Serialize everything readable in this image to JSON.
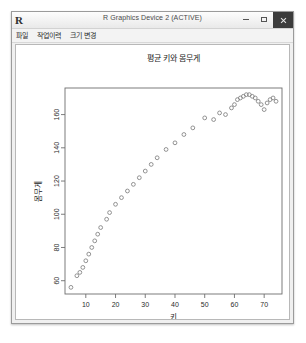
{
  "window": {
    "app_logo": "R",
    "title": "R Graphics Device 2 (ACTIVE)",
    "buttons": {
      "minimize": "minimize-icon",
      "maximize": "maximize-icon",
      "close": "close-icon"
    }
  },
  "menubar": {
    "items": [
      {
        "label": "파일"
      },
      {
        "label": "작업이력"
      },
      {
        "label": "크기 변경"
      }
    ]
  },
  "chart_data": {
    "type": "scatter",
    "title": "평균 키와 몸무게",
    "xlabel": "키",
    "ylabel": "몸무게",
    "xlim": [
      3,
      76
    ],
    "ylim": [
      52,
      176
    ],
    "xticks": [
      10,
      20,
      30,
      40,
      50,
      60,
      70
    ],
    "yticks": [
      60,
      80,
      100,
      120,
      140,
      160
    ],
    "grid": false,
    "legend": null,
    "point_symbol": "open-circle",
    "point_color": "#808080",
    "x": [
      5,
      7,
      8,
      9,
      10,
      11,
      12,
      13,
      14,
      15,
      17,
      18,
      20,
      22,
      24,
      26,
      28,
      30,
      32,
      34,
      37,
      40,
      43,
      46,
      50,
      53,
      55,
      57,
      59,
      60,
      61,
      62,
      63,
      64,
      65,
      66,
      67,
      68,
      69,
      70,
      71,
      72,
      73,
      74
    ],
    "y": [
      56,
      63,
      65,
      68,
      72,
      76,
      80,
      84,
      88,
      92,
      97,
      101,
      106,
      110,
      114,
      118,
      122,
      126,
      130,
      134,
      139,
      143,
      148,
      152,
      158,
      157,
      161,
      160,
      164,
      166,
      169,
      170,
      171,
      172,
      172,
      171,
      170,
      168,
      166,
      163,
      167,
      169,
      170,
      168
    ]
  }
}
